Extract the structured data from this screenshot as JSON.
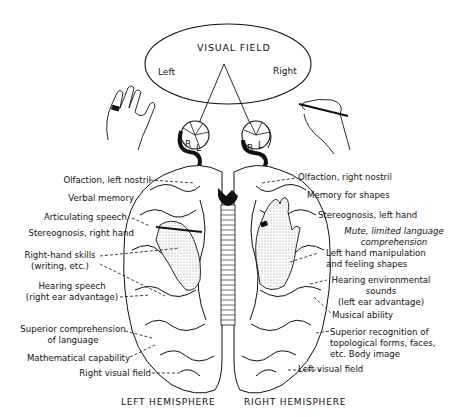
{
  "visual_field": {
    "title": "VISUAL FIELD",
    "left": "Left",
    "right": "Right"
  },
  "eyes": {
    "left_eye": {
      "r": "R",
      "l": "L"
    },
    "right_eye": {
      "r": "R",
      "l": "L"
    }
  },
  "left_labels": [
    {
      "lines": [
        "Olfaction, left nostril"
      ]
    },
    {
      "lines": [
        "Verbal memory"
      ]
    },
    {
      "lines": [
        "Articulating speech"
      ]
    },
    {
      "lines": [
        "Stereognosis, right hand"
      ]
    },
    {
      "lines": [
        "Right-hand skills",
        "(writing, etc.)"
      ]
    },
    {
      "lines": [
        "Hearing speech",
        "(right ear advantage)"
      ]
    },
    {
      "lines": [
        "Superior comprehension",
        "of language"
      ]
    },
    {
      "lines": [
        "Mathematical capability"
      ]
    },
    {
      "lines": [
        "Right visual field"
      ]
    }
  ],
  "right_labels": [
    {
      "lines": [
        "Olfaction, right nostril"
      ]
    },
    {
      "lines": [
        "Memory for shapes"
      ]
    },
    {
      "lines": [
        "Stereognosis, left hand"
      ]
    },
    {
      "lines": [
        "Mute, limited language",
        "comprehension"
      ],
      "italic": true
    },
    {
      "lines": [
        "Left hand manipulation",
        "and feeling shapes"
      ]
    },
    {
      "lines": [
        "Hearing environmental",
        "sounds",
        "(left ear advantage)"
      ]
    },
    {
      "lines": [
        "Musical ability"
      ]
    },
    {
      "lines": [
        "Superior recognition of",
        "topological forms, faces,",
        "etc. Body image"
      ]
    },
    {
      "lines": [
        "Left visual field"
      ]
    }
  ],
  "hemispheres": {
    "left": "LEFT HEMISPHERE",
    "right": "RIGHT HEMISPHERE"
  },
  "colors": {
    "ink": "#111111",
    "background": "#ffffff",
    "shading": "#d8d8d8"
  }
}
